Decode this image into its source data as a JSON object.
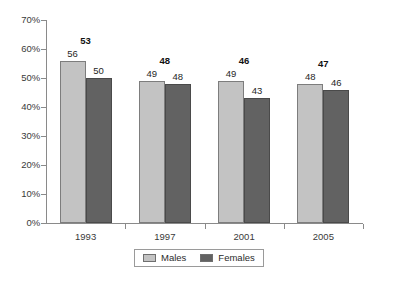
{
  "chart_data": {
    "type": "bar",
    "title": "",
    "subtitle": "",
    "xlabel": "",
    "ylabel": "",
    "categories": [
      "1993",
      "1997",
      "2001",
      "2005"
    ],
    "series": [
      {
        "name": "Males",
        "color": "#c3c3c3",
        "values": [
          56,
          49,
          49,
          48
        ]
      },
      {
        "name": "Females",
        "color": "#626262",
        "values": [
          50,
          48,
          43,
          46
        ]
      }
    ],
    "group_totals": [
      53,
      48,
      46,
      47
    ],
    "ylim": [
      0,
      70
    ],
    "ytick_values": [
      0,
      10,
      20,
      30,
      40,
      50,
      60,
      70
    ],
    "ytick_labels": [
      "0%",
      "10%",
      "20%",
      "30%",
      "40%",
      "50%",
      "60%",
      "70%"
    ],
    "grid": false,
    "legend_position": "bottom",
    "value_labels_shown": true
  },
  "legend": {
    "entries": [
      {
        "label": "Males"
      },
      {
        "label": "Females"
      }
    ]
  }
}
